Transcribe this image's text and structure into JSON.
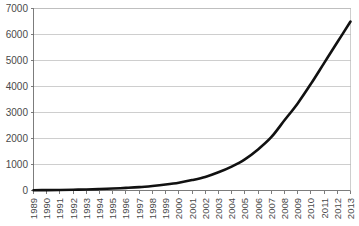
{
  "chart_data": {
    "type": "line",
    "title": "",
    "subtitle": "",
    "xlabel": "",
    "ylabel": "",
    "grid": true,
    "legend": false,
    "legend_position": "none",
    "line_color": "#111111",
    "x": [
      1989,
      1990,
      1991,
      1992,
      1993,
      1994,
      1995,
      1996,
      1997,
      1998,
      1999,
      2000,
      2001,
      2002,
      2003,
      2004,
      2005,
      2006,
      2007,
      2008,
      2009,
      2010,
      2011,
      2012,
      2013
    ],
    "categories": [
      "1989",
      "1990",
      "1991",
      "1992",
      "1993",
      "1994",
      "1995",
      "1996",
      "1997",
      "1998",
      "1999",
      "2000",
      "2001",
      "2002",
      "2003",
      "2004",
      "2005",
      "2006",
      "2007",
      "2008",
      "2009",
      "2010",
      "2011",
      "2012",
      "2013"
    ],
    "values": [
      10,
      15,
      20,
      30,
      40,
      55,
      75,
      100,
      130,
      175,
      230,
      300,
      400,
      520,
      700,
      920,
      1200,
      1580,
      2050,
      2700,
      3350,
      4100,
      4900,
      5700,
      6500
    ],
    "series": [
      {
        "name": "series-1",
        "values": [
          10,
          15,
          20,
          30,
          40,
          55,
          75,
          100,
          130,
          175,
          230,
          300,
          400,
          520,
          700,
          920,
          1200,
          1580,
          2050,
          2700,
          3350,
          4100,
          4900,
          5700,
          6500
        ]
      }
    ],
    "xlim": [
      1989,
      2013
    ],
    "ylim": [
      0,
      7000
    ],
    "ytick_values": [
      0,
      1000,
      2000,
      3000,
      4000,
      5000,
      6000,
      7000
    ],
    "ytick_labels": [
      "0",
      "1000",
      "2000",
      "3000",
      "4000",
      "5000",
      "6000",
      "7000"
    ],
    "ytick_step": 1000
  }
}
